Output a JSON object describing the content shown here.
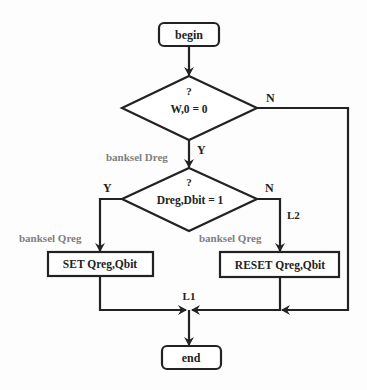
{
  "diagram": {
    "type": "flowchart",
    "nodes": {
      "begin": {
        "label": "begin",
        "shape": "rounded-rect"
      },
      "decision1": {
        "question": "?",
        "label": "W,0  = 0",
        "shape": "diamond"
      },
      "decision2": {
        "question": "?",
        "label": "Dreg,Dbit  = 1",
        "shape": "diamond"
      },
      "set": {
        "label": "SET Qreg,Qbit",
        "shape": "rect"
      },
      "reset": {
        "label": "RESET Qreg,Qbit",
        "shape": "rect"
      },
      "end": {
        "label": "end",
        "shape": "rounded-rect"
      }
    },
    "edge_labels": {
      "d1_no": "N",
      "d1_yes": "Y",
      "d2_yes": "Y",
      "d2_no": "N",
      "l2": "L2",
      "l1": "L1"
    },
    "annotations": {
      "banksel_dreg": "banksel Dreg",
      "banksel_qreg_left": "banksel Qreg",
      "banksel_qreg_right": "banksel Qreg"
    },
    "colors": {
      "stroke": "#222222",
      "annotation": "#808080",
      "background": "#fdfdfd"
    }
  }
}
